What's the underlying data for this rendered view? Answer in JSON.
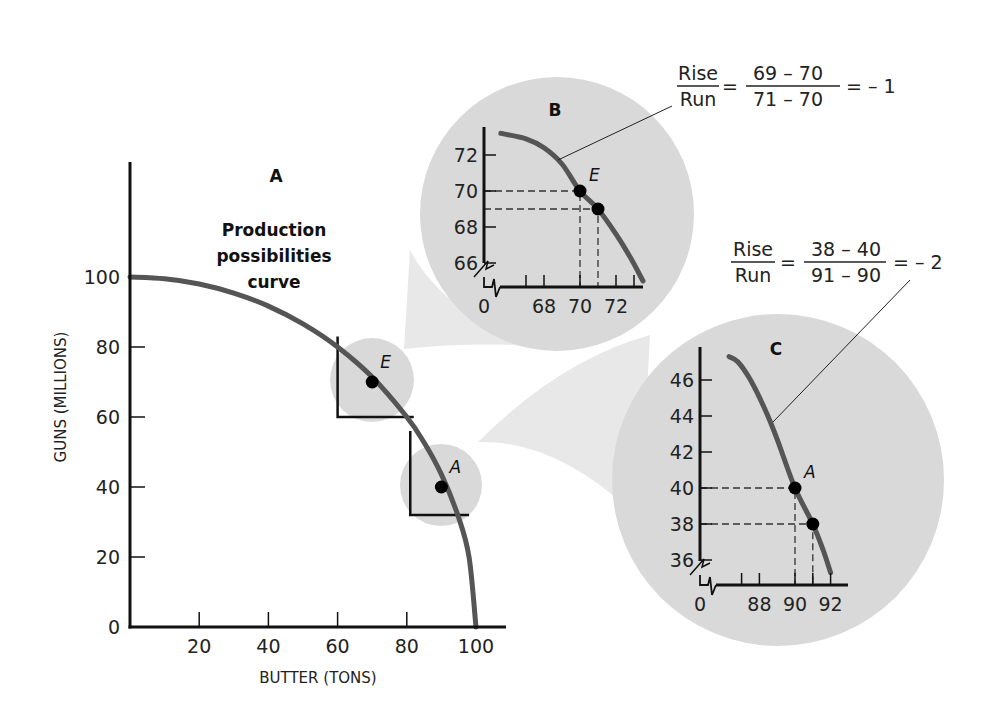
{
  "colors": {
    "curve": "#555555",
    "axis": "#111111",
    "circle_fill": "#d9d9d9",
    "cone_fill": "#e8e8e8",
    "point": "#000000"
  },
  "chart_data": [
    {
      "id": "A",
      "type": "line",
      "panel_label": "A",
      "annotation": [
        "Production",
        "possibilities",
        "curve"
      ],
      "xlabel": "BUTTER (TONS)",
      "ylabel": "GUNS (MILLIONS)",
      "xlim": [
        0,
        108
      ],
      "ylim": [
        0,
        128
      ],
      "xticks": [
        20,
        40,
        60,
        80,
        100
      ],
      "yticks": [
        0,
        20,
        40,
        60,
        80,
        100
      ],
      "series": [
        {
          "name": "Production possibilities curve",
          "x": [
            0,
            10,
            20,
            30,
            40,
            50,
            60,
            70,
            80,
            85,
            90,
            95,
            98,
            100
          ],
          "y": [
            100,
            99.5,
            98,
            95.4,
            91.7,
            86.6,
            80,
            71.4,
            60,
            52.7,
            43.6,
            31.2,
            19.9,
            0
          ]
        }
      ],
      "points": [
        {
          "label": "E",
          "x": 70,
          "y": 70
        },
        {
          "label": "A",
          "x": 90,
          "y": 40
        }
      ],
      "zoom_regions": [
        {
          "label": "E",
          "x": [
            60,
            82
          ],
          "y": [
            60,
            83
          ]
        },
        {
          "label": "A",
          "x": [
            81,
            98
          ],
          "y": [
            32,
            56
          ]
        }
      ],
      "grid": false
    },
    {
      "id": "B",
      "type": "line",
      "panel_label": "B",
      "x_tick_labels": [
        "0",
        "68",
        "70",
        "72"
      ],
      "y_tick_labels": [
        "66",
        "68",
        "70",
        "72"
      ],
      "xticks": [
        67,
        68,
        70,
        72,
        73
      ],
      "yticks": [
        66,
        68,
        70,
        72
      ],
      "axis_break": true,
      "xlim": [
        65.5,
        74.5
      ],
      "ylim": [
        65,
        73.5
      ],
      "series": [
        {
          "name": "Production possibilities curve",
          "x": [
            65.6,
            67,
            68,
            69,
            70,
            71,
            72,
            72.8,
            73.5
          ],
          "y": [
            73.2,
            72.9,
            72.4,
            71.5,
            70,
            69,
            67.6,
            66.3,
            65
          ]
        }
      ],
      "points": [
        {
          "label": "E",
          "x": 70,
          "y": 70
        },
        {
          "label": "",
          "x": 71,
          "y": 69
        }
      ],
      "equation": {
        "rise": "Rise",
        "run": "Run",
        "num": "69 – 70",
        "den": "71 – 70",
        "result": "= – 1"
      }
    },
    {
      "id": "C",
      "type": "line",
      "panel_label": "C",
      "x_tick_labels": [
        "0",
        "88",
        "90",
        "92"
      ],
      "y_tick_labels": [
        "36",
        "38",
        "40",
        "42",
        "44",
        "46"
      ],
      "xticks": [
        87,
        88,
        90,
        91,
        92
      ],
      "yticks": [
        36,
        38,
        40,
        42,
        44,
        46
      ],
      "axis_break": true,
      "xlim": [
        86.3,
        93
      ],
      "ylim": [
        35.3,
        47.5
      ],
      "series": [
        {
          "name": "Production possibilities curve",
          "x": [
            86.3,
            86.8,
            87.5,
            88.3,
            89,
            90,
            91,
            91.6,
            92
          ],
          "y": [
            47.3,
            47.0,
            46.0,
            44.4,
            42.7,
            40,
            38,
            36.5,
            35.3
          ]
        }
      ],
      "points": [
        {
          "label": "A",
          "x": 90,
          "y": 40
        },
        {
          "label": "",
          "x": 91,
          "y": 38
        }
      ],
      "equation": {
        "rise": "Rise",
        "run": "Run",
        "num": "38 – 40",
        "den": "91 – 90",
        "result": "= – 2"
      }
    }
  ]
}
